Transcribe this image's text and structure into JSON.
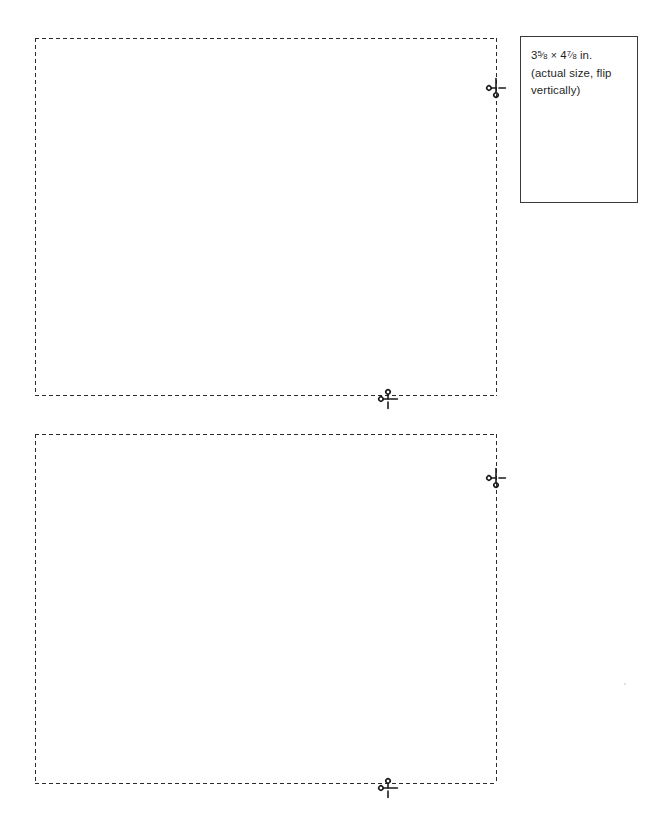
{
  "document": {
    "title": "Printable card cut-out sheet",
    "background_color": "#ffffff",
    "width": 672,
    "height": 839
  },
  "label_box": {
    "name": "size-callout",
    "border_color": "#3a3a3a",
    "size_prefix": "3",
    "size_frac1_num": "5",
    "size_frac1_den": "8",
    "size_separator": "×",
    "size_second": "4",
    "size_frac2_num": "7",
    "size_frac2_den": "8",
    "size_unit": "in.",
    "note_line_1": "(actual size, flip",
    "note_line_2": "vertically)",
    "full_text": "3 5/8 × 4 7/8 in. (actual size, flip vertically)"
  },
  "cut_areas": [
    {
      "name": "card-cut-area-top",
      "index": 1,
      "x": 35,
      "y": 38,
      "width": 462,
      "height": 358,
      "border_style": "dashed",
      "border_color": "#2b2b2b"
    },
    {
      "name": "card-cut-area-bottom",
      "index": 2,
      "x": 35,
      "y": 434,
      "width": 462,
      "height": 350,
      "border_style": "dashed",
      "border_color": "#2b2b2b"
    }
  ],
  "scissors_markers": [
    {
      "name": "scissors-marker-top-right-edge",
      "orientation": "vertical",
      "x": 486,
      "y": 78
    },
    {
      "name": "scissors-marker-top-bottom-edge",
      "orientation": "horizontal",
      "x": 378,
      "y": 389
    },
    {
      "name": "scissors-marker-bottom-right-edge",
      "orientation": "vertical",
      "x": 486,
      "y": 468
    },
    {
      "name": "scissors-marker-bottom-bottom-edge",
      "orientation": "horizontal",
      "x": 378,
      "y": 778
    }
  ],
  "icons": {
    "scissors": "scissors-icon"
  },
  "speck": {
    "name": "page-speck",
    "x": 624,
    "y": 683,
    "color": "#d8d8d8"
  }
}
